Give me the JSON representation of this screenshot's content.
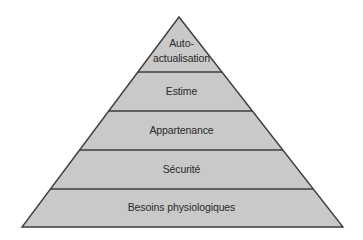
{
  "diagram": {
    "type": "pyramid",
    "title": "",
    "colors": {
      "fill": "#c9c9c9",
      "stroke": "#3c3c3c",
      "text": "#2a2a2a",
      "background": "#ffffff"
    },
    "levels": [
      {
        "order": 1,
        "position": "top",
        "label_line1": "Auto-",
        "label_line2": "actualisation"
      },
      {
        "order": 2,
        "label": "Estime"
      },
      {
        "order": 3,
        "label": "Appartenance"
      },
      {
        "order": 4,
        "label": "Sécurité"
      },
      {
        "order": 5,
        "position": "base",
        "label": "Besoins physiologiques"
      }
    ]
  }
}
